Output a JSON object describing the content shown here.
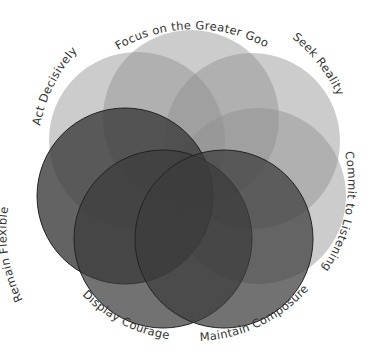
{
  "diagram": {
    "type": "overlapping-circles",
    "circles": [
      {
        "id": "act-decisively",
        "label": "Act Decisively",
        "cx": 137,
        "cy": 140,
        "r": 88,
        "fill": "#8a8a8a",
        "opacity": 0.45,
        "stroke": "none"
      },
      {
        "id": "focus-greater-good",
        "label": "Focus on the Greater Good",
        "cx": 191,
        "cy": 118,
        "r": 88,
        "fill": "#8a8a8a",
        "opacity": 0.45,
        "stroke": "none"
      },
      {
        "id": "seek-reality",
        "label": "Seek Reality",
        "cx": 252,
        "cy": 141,
        "r": 88,
        "fill": "#8a8a8a",
        "opacity": 0.45,
        "stroke": "none"
      },
      {
        "id": "commit-to-listening",
        "label": "Commit to Listening",
        "cx": 258,
        "cy": 196,
        "r": 88,
        "fill": "#8a8a8a",
        "opacity": 0.45,
        "stroke": "none"
      },
      {
        "id": "remain-flexible",
        "label": "Remain Flexible",
        "cx": 125,
        "cy": 196,
        "r": 88,
        "fill": "#3a3a3a",
        "opacity": 0.8,
        "stroke": "#222222"
      },
      {
        "id": "display-courage",
        "label": "Display Courage",
        "cx": 163,
        "cy": 239,
        "r": 89,
        "fill": "#3a3a3a",
        "opacity": 0.75,
        "stroke": "#222222"
      },
      {
        "id": "maintain-composure",
        "label": "Maintain Composure",
        "cx": 224,
        "cy": 239,
        "r": 89,
        "fill": "#3a3a3a",
        "opacity": 0.75,
        "stroke": "#222222"
      }
    ],
    "labels": {
      "act_decisively": "Act Decisively",
      "focus_greater_good": "Focus on the Greater Good",
      "seek_reality": "Seek Reality",
      "commit_to_listening": "Commit to Listening",
      "remain_flexible": "Remain Flexible",
      "display_courage": "Display Courage",
      "maintain_composure": "Maintain Composure"
    }
  }
}
